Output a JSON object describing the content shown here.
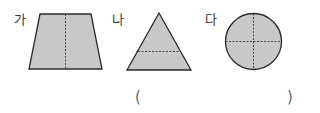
{
  "figures": [
    {
      "label": "가",
      "shape": "trapezoid",
      "divider": "vertical-dashed"
    },
    {
      "label": "나",
      "shape": "triangle",
      "divider": "horizontal-dashed"
    },
    {
      "label": "다",
      "shape": "circle",
      "divider": "cross-dashed"
    }
  ],
  "answer": {
    "open_paren": "(",
    "close_paren": ")",
    "value": ""
  },
  "colors": {
    "fill": "#c8c8c8",
    "stroke": "#2a2a2a",
    "dash": "#444444"
  }
}
